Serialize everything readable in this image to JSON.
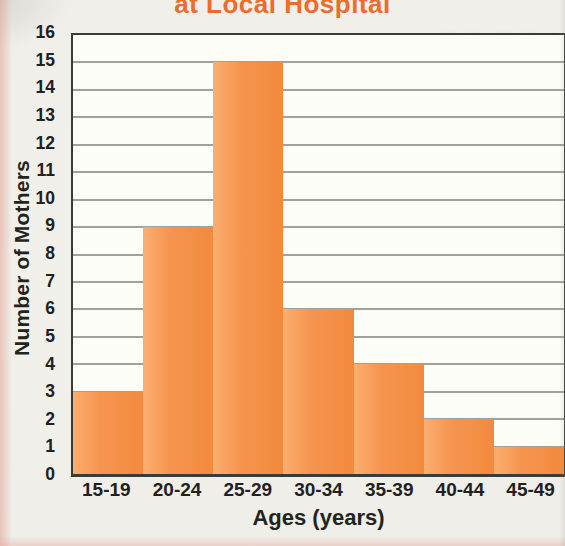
{
  "chart_data": {
    "type": "bar",
    "title": "at Local Hospital",
    "title_color": "#ec6c2e",
    "categories": [
      "15-19",
      "20-24",
      "25-29",
      "30-34",
      "35-39",
      "40-44",
      "45-49"
    ],
    "values": [
      3,
      9,
      15,
      6,
      4,
      2,
      1
    ],
    "xlabel": "Ages (years)",
    "ylabel": "Number of Mothers",
    "ylim": [
      0,
      16
    ],
    "yticks": [
      0,
      1,
      2,
      3,
      4,
      5,
      6,
      7,
      8,
      9,
      10,
      11,
      12,
      13,
      14,
      15,
      16
    ],
    "grid": "horizontal",
    "legend": "none",
    "bar_gap": 0,
    "bar_color": "#f5914a",
    "bar_gradient": [
      "#fbae70",
      "#f28a3e"
    ]
  }
}
